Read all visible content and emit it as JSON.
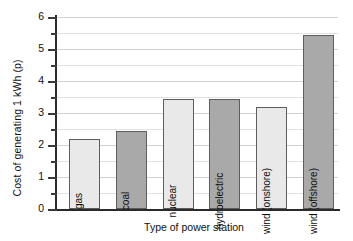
{
  "chart_data": {
    "type": "bar",
    "title": "",
    "xlabel": "Type of power station",
    "ylabel": "Cost of generating 1 kWh (p)",
    "categories": [
      "gas",
      "coal",
      "nuclear",
      "hydroelectric",
      "wind (onshore)",
      "wind (offshore)"
    ],
    "values": [
      2.2,
      2.45,
      3.45,
      3.45,
      3.2,
      5.45
    ],
    "ylim": [
      0,
      6
    ],
    "y_major_ticks": [
      0,
      1,
      2,
      3,
      4,
      5,
      6
    ],
    "y_minor_ticks": [
      0.5,
      1.5,
      2.5,
      3.5,
      4.5,
      5.5
    ],
    "y_tick_labels": [
      "0",
      "1",
      "2",
      "3",
      "4",
      "5",
      "6"
    ],
    "grid": true,
    "legend": "none",
    "bar_colors": [
      "#e9e9e9",
      "#a9a9a9",
      "#e9e9e9",
      "#a9a9a9",
      "#e9e9e9",
      "#a9a9a9"
    ],
    "bar_border_color": "#5d5d5d",
    "gridline_color": "#e2e2e2",
    "axis_color": "#2a2a2a",
    "background_color": "#ffffff",
    "series": [
      {
        "name": "Cost of generating 1 kWh (p)",
        "values": [
          2.2,
          2.45,
          3.45,
          3.45,
          3.2,
          5.45
        ]
      }
    ]
  },
  "axes": {
    "y_title": "Cost of generating 1 kWh (p)",
    "x_title": "Type of power station"
  }
}
